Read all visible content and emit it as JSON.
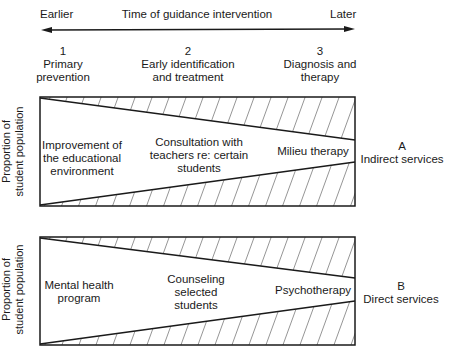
{
  "timeline": {
    "left_label": "Earlier",
    "title": "Time of guidance intervention",
    "right_label": "Later"
  },
  "stages": [
    {
      "number": "1",
      "line1": "Primary",
      "line2": "prevention"
    },
    {
      "number": "2",
      "line1": "Early identification",
      "line2": "and treatment"
    },
    {
      "number": "3",
      "line1": "Diagnosis and",
      "line2": "therapy"
    }
  ],
  "panels": [
    {
      "y_label_line1": "Proportion of",
      "y_label_line2": "student population",
      "col1": [
        "Improvement of",
        "the educational",
        "environment"
      ],
      "col2": [
        "Consultation with",
        "teachers re: certain",
        "students"
      ],
      "col3": [
        "Milieu therapy"
      ],
      "side_letter": "A",
      "side_label": "Indirect services"
    },
    {
      "y_label_line1": "Proportion of",
      "y_label_line2": "student population",
      "col1": [
        "Mental health",
        "program"
      ],
      "col2": [
        "Counseling",
        "selected",
        "students"
      ],
      "col3": [
        "Psychotherapy"
      ],
      "side_letter": "B",
      "side_label": "Direct services"
    }
  ],
  "colors": {
    "ink": "#1a1a1a",
    "background": "#ffffff"
  }
}
